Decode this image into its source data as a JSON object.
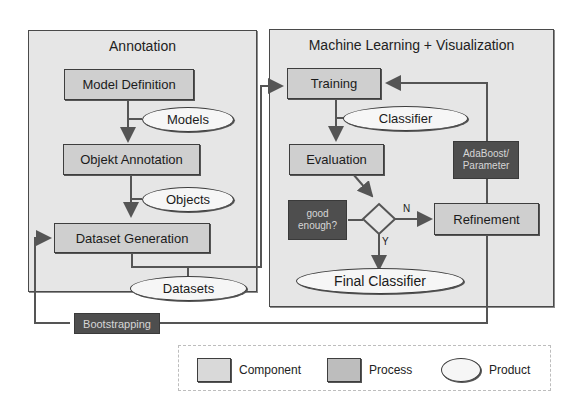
{
  "panels": {
    "annotation": {
      "title": "Annotation"
    },
    "ml": {
      "title": "Machine Learning + Visualization"
    }
  },
  "components": {
    "model_definition": "Model Definition",
    "objekt_annotation": "Objekt Annotation",
    "dataset_generation": "Dataset Generation",
    "training": "Training",
    "evaluation": "Evaluation",
    "refinement": "Refinement"
  },
  "products": {
    "models": "Models",
    "objects": "Objects",
    "datasets": "Datasets",
    "classifier": "Classifier",
    "final_classifier": "Final Classifier"
  },
  "processes": {
    "bootstrapping": "Bootstrapping",
    "adaboost_line1": "AdaBoost/",
    "adaboost_line2": "Parameter",
    "good_enough_line1": "good",
    "good_enough_line2": "enough?"
  },
  "decision": {
    "no_label": "N",
    "yes_label": "Y"
  },
  "legend": {
    "component": "Component",
    "process": "Process",
    "product": "Product"
  },
  "colors": {
    "panel_bg": "#e6e6e6",
    "component_bg": "#cfcfcf",
    "process_bg": "#4e4e4e",
    "product_bg": "#f6f6f6",
    "line": "#555555"
  }
}
